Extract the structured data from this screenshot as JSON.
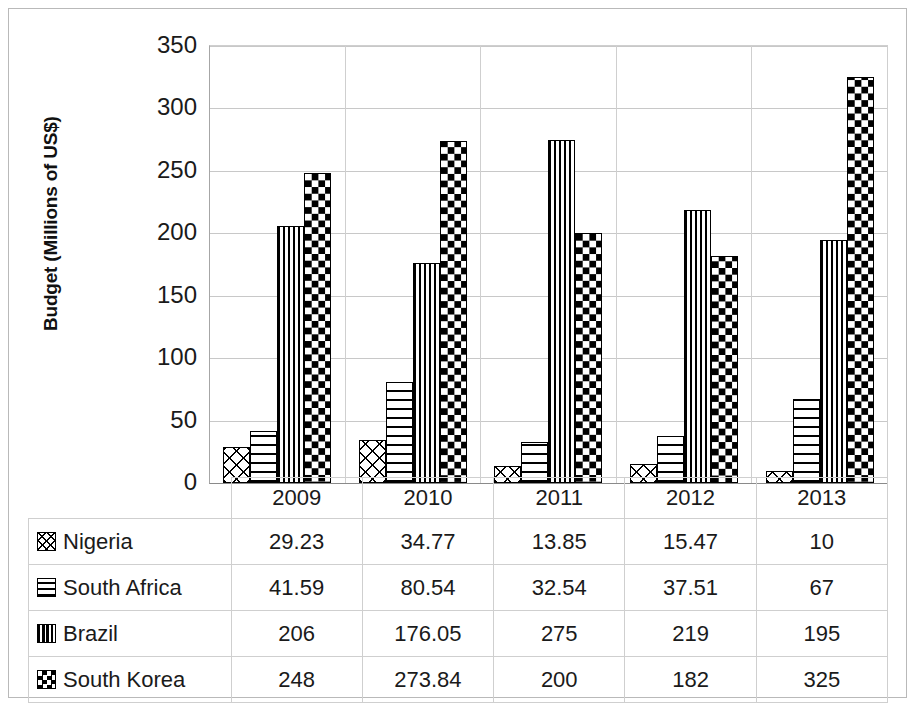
{
  "chart_data": {
    "type": "bar",
    "title": "",
    "xlabel": "",
    "ylabel": "Budget (Millions of US$)",
    "ylim": [
      0,
      350
    ],
    "ytick_values": [
      0,
      50,
      100,
      150,
      200,
      250,
      300,
      350
    ],
    "ytick_labels": [
      "0",
      "50",
      "100",
      "150",
      "200",
      "250",
      "300",
      "350"
    ],
    "grid": true,
    "legend_position": "data-table",
    "categories": [
      "2009",
      "2010",
      "2011",
      "2012",
      "2013"
    ],
    "series": [
      {
        "name": "Nigeria",
        "pattern": "diagonal-cross-hatch",
        "values": [
          29.23,
          34.77,
          13.85,
          15.47,
          10
        ],
        "labels": [
          "29.23",
          "34.77",
          "13.85",
          "15.47",
          "10"
        ]
      },
      {
        "name": "South Africa",
        "pattern": "horizontal-lines",
        "values": [
          41.59,
          80.54,
          32.54,
          37.51,
          67
        ],
        "labels": [
          "41.59",
          "80.54",
          "32.54",
          "37.51",
          "67"
        ]
      },
      {
        "name": "Brazil",
        "pattern": "vertical-lines",
        "values": [
          206,
          176.05,
          275,
          219,
          195
        ],
        "labels": [
          "206",
          "176.05",
          "275",
          "219",
          "195"
        ]
      },
      {
        "name": "South Korea",
        "pattern": "black-diamond-checker",
        "values": [
          248,
          273.84,
          200,
          182,
          325
        ],
        "labels": [
          "248",
          "273.84",
          "200",
          "182",
          "325"
        ]
      }
    ]
  },
  "table": {
    "corner_label": "",
    "column_headers": [
      "2009",
      "2010",
      "2011",
      "2012",
      "2013"
    ],
    "rows": [
      {
        "label": "Nigeria",
        "swatch": "nigeria-swatch-icon",
        "cells": [
          "29.23",
          "34.77",
          "13.85",
          "15.47",
          "10"
        ]
      },
      {
        "label": "South Africa",
        "swatch": "south-africa-swatch-icon",
        "cells": [
          "41.59",
          "80.54",
          "32.54",
          "37.51",
          "67"
        ]
      },
      {
        "label": "Brazil",
        "swatch": "brazil-swatch-icon",
        "cells": [
          "206",
          "176.05",
          "275",
          "219",
          "195"
        ]
      },
      {
        "label": "South Korea",
        "swatch": "south-korea-swatch-icon",
        "cells": [
          "248",
          "273.84",
          "200",
          "182",
          "325"
        ]
      }
    ]
  },
  "colors": {
    "bar_outline": "#000000",
    "bar_fill": "#ffffff",
    "pattern": "#000000",
    "gridline": "#c8c8c8",
    "axis": "#8a8a8a",
    "text": "#1a1a1a",
    "frame": "#b9b9b9",
    "background": "#ffffff"
  }
}
